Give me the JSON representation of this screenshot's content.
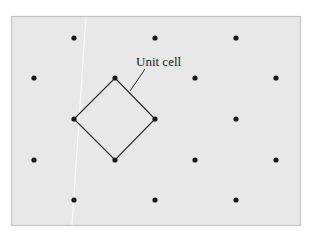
{
  "diagram": {
    "label": "Unit cell",
    "colors": {
      "background": "#e8e8e8",
      "frame": "#c4c4c4",
      "point": "#1a1a1a",
      "line": "#2a2a2a"
    },
    "lattice_points": [
      [
        74,
        38
      ],
      [
        155,
        38
      ],
      [
        236,
        38
      ],
      [
        34,
        78
      ],
      [
        115,
        78
      ],
      [
        195,
        78
      ],
      [
        276,
        78
      ],
      [
        74,
        119
      ],
      [
        155,
        119
      ],
      [
        236,
        119
      ],
      [
        34,
        160
      ],
      [
        115,
        160
      ],
      [
        195,
        160
      ],
      [
        276,
        160
      ],
      [
        74,
        200
      ],
      [
        155,
        200
      ],
      [
        236,
        200
      ]
    ],
    "unit_cell": [
      [
        115,
        78
      ],
      [
        155,
        119
      ],
      [
        115,
        160
      ],
      [
        74,
        119
      ]
    ]
  }
}
